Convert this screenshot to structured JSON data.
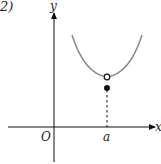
{
  "figure": {
    "part_label": "2)",
    "axes": {
      "x_label": "x",
      "y_label": "y",
      "origin_label": "O"
    },
    "point_label": "a",
    "colors": {
      "curve": "#888888",
      "axis": "#111111",
      "point": "#111111"
    },
    "elements": [
      {
        "type": "curve",
        "description": "U-shaped curve with minimum at x=a (open point)"
      },
      {
        "type": "open-circle",
        "at": "(a, f-limit)"
      },
      {
        "type": "filled-dot",
        "at": "(a, f(a))",
        "below_open_circle": true
      },
      {
        "type": "dashed-line",
        "from": "filled dot",
        "to": "x-axis at a"
      }
    ]
  }
}
